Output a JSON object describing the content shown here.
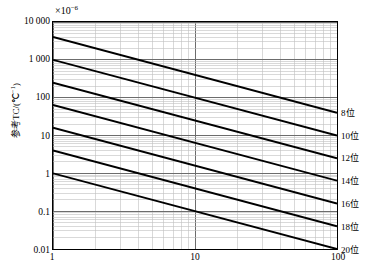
{
  "chart_data": {
    "type": "line",
    "title": "",
    "subtitle": "",
    "multiplier_prefix": "×10",
    "multiplier_exponent": "−6",
    "xlabel": "",
    "ylabel": "参考TC/(℃",
    "ylabel_sup": "−1",
    "ylabel_suffix": ")",
    "xscale": "log",
    "yscale": "log",
    "xlim": [
      1,
      100
    ],
    "ylim": [
      0.01,
      10000
    ],
    "grid": true,
    "grid_minor": true,
    "legend_position": "right-outside",
    "x_ticks": [
      {
        "value": 1,
        "label": "1"
      },
      {
        "value": 10,
        "label": "10"
      },
      {
        "value": 100,
        "label": "100"
      }
    ],
    "y_ticks": [
      {
        "value": 10000,
        "label": "10 000"
      },
      {
        "value": 1000,
        "label": "1 000"
      },
      {
        "value": 100,
        "label": "100"
      },
      {
        "value": 10,
        "label": "10"
      },
      {
        "value": 1,
        "label": "1"
      },
      {
        "value": 0.1,
        "label": "0.1"
      },
      {
        "value": 0.01,
        "label": "0.01"
      }
    ],
    "series": [
      {
        "name": "8位",
        "bits": 8,
        "y_at_x1": 4000,
        "y_at_x100": 40,
        "slope": -1
      },
      {
        "name": "10位",
        "bits": 10,
        "y_at_x1": 1000,
        "y_at_x100": 10,
        "slope": -1
      },
      {
        "name": "12位",
        "bits": 12,
        "y_at_x1": 250,
        "y_at_x100": 2.5,
        "slope": -1
      },
      {
        "name": "14位",
        "bits": 14,
        "y_at_x1": 64,
        "y_at_x100": 0.64,
        "slope": -1
      },
      {
        "name": "16位",
        "bits": 16,
        "y_at_x1": 16,
        "y_at_x100": 0.16,
        "slope": -1
      },
      {
        "name": "18位",
        "bits": 18,
        "y_at_x1": 4,
        "y_at_x100": 0.04,
        "slope": -1
      },
      {
        "name": "20位",
        "bits": 20,
        "y_at_x1": 1,
        "y_at_x100": 0.01,
        "slope": -1
      }
    ],
    "legend_entries": [
      {
        "label": "8位",
        "anchor_y": 40
      },
      {
        "label": "10位",
        "anchor_y": 10
      },
      {
        "label": "12位",
        "anchor_y": 2.5
      },
      {
        "label": "14位",
        "anchor_y": 0.64
      },
      {
        "label": "16位",
        "anchor_y": 0.16
      },
      {
        "label": "18位",
        "anchor_y": 0.04
      },
      {
        "label": "20位",
        "anchor_y": 0.01
      }
    ],
    "colors": {
      "line": "#000000",
      "grid_major": "#6b6b6b",
      "grid_minor": "#bfbfbf",
      "frame": "#000000",
      "background": "#ffffff"
    }
  }
}
